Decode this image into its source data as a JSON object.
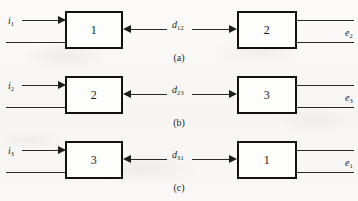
{
  "figure": {
    "type": "block-diagram",
    "rows": [
      {
        "caption": "(a)",
        "input_label": "i",
        "input_subscript": "1",
        "left_block_label": "1",
        "distance_label": "d",
        "distance_subscript": "12",
        "right_block_label": "2",
        "output_label": "e",
        "output_subscript": "2"
      },
      {
        "caption": "(b)",
        "input_label": "i",
        "input_subscript": "2",
        "left_block_label": "2",
        "distance_label": "d",
        "distance_subscript": "23",
        "right_block_label": "3",
        "output_label": "e",
        "output_subscript": "3"
      },
      {
        "caption": "(c)",
        "input_label": "i",
        "input_subscript": "3",
        "left_block_label": "3",
        "distance_label": "d",
        "distance_subscript": "31",
        "right_block_label": "1",
        "output_label": "e",
        "output_subscript": "1"
      }
    ],
    "icons": {
      "input_arrow": "arrow-right-icon",
      "distance_arrow_left": "arrow-left-icon",
      "distance_arrow_right": "arrow-right-icon"
    },
    "colors": {
      "page_background": "#fbfaf8",
      "block_stroke": "#111111",
      "line_stroke": "#2a2a2a",
      "text": "#1f1f1f"
    }
  }
}
